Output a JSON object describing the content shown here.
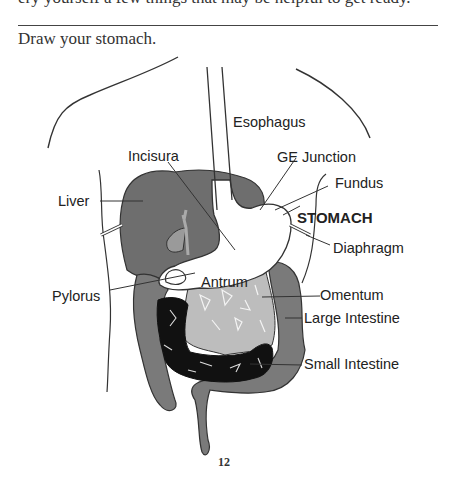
{
  "page": {
    "cut_off_text": "ery yourself a few things that may be helpful to get ready.",
    "prompt": "Draw your stomach.",
    "page_number": "12"
  },
  "diagram": {
    "labels": {
      "esophagus": "Esophagus",
      "incisura": "Incisura",
      "ge_junction": "GE Junction",
      "fundus": "Fundus",
      "liver": "Liver",
      "stomach": "STOMACH",
      "diaphragm": "Diaphragm",
      "pylorus": "Pylorus",
      "antrum": "Antrum",
      "omentum": "Omentum",
      "large_intestine": "Large Intestine",
      "small_intestine": "Small Intestine"
    },
    "colors": {
      "liver": "#6e6e6e",
      "large_intestine": "#7a7a7a",
      "omentum": "#bdbdbd",
      "small_intestine": "#111111",
      "stomach": "#ffffff",
      "outline": "#333333"
    }
  }
}
